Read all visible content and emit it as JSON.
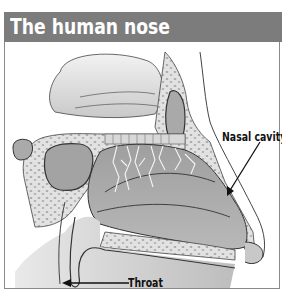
{
  "header": {
    "title": "The human nose",
    "background_color": "#7c7c7c",
    "text_color": "#ffffff"
  },
  "diagram": {
    "labels": [
      {
        "id": "nasal-cavity",
        "text": "Nasal cavity",
        "arrow": "points down-left into nasal cavity"
      },
      {
        "id": "throat",
        "text": "Throat",
        "arrow": "points left to the throat/nasopharynx"
      }
    ]
  }
}
